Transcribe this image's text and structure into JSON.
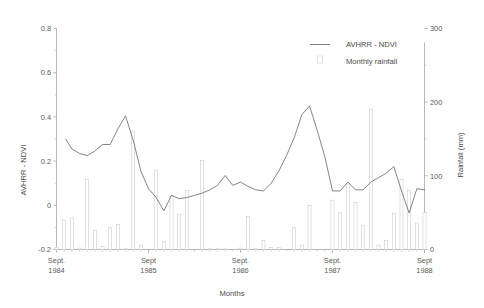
{
  "chart_data": {
    "type": "line",
    "title": "",
    "xlabel": "Months",
    "ylabel": "AVHRR - NDVI",
    "y2label": "Rainfall (mm)",
    "ylim": [
      -0.2,
      0.8
    ],
    "y2lim": [
      0,
      300
    ],
    "yticks": [
      "0.8",
      "0.6",
      "0.4",
      "0.2",
      "0",
      "-0.2"
    ],
    "ytick_values": [
      0.8,
      0.6,
      0.4,
      0.2,
      0,
      -0.2
    ],
    "y2ticks": [
      "300",
      "200",
      "100",
      "0"
    ],
    "y2tick_values": [
      300,
      200,
      100,
      0
    ],
    "grid": false,
    "legend_position": "top-right",
    "legend": [
      {
        "label": "AVHRR - NDVI",
        "marker": "line",
        "color": "#6f6f6f"
      },
      {
        "label": "Monthly rainfall",
        "marker": "bar",
        "color": "#c9c9c9"
      }
    ],
    "xtick_labels": [
      {
        "month": "Sept.",
        "year": "1984",
        "index": 0
      },
      {
        "month": "Sept",
        "year": "1985",
        "index": 12
      },
      {
        "month": "Sept.",
        "year": "1986",
        "index": 24
      },
      {
        "month": "Sept.",
        "year": "1987",
        "index": 36
      },
      {
        "month": "Sept",
        "year": "1988",
        "index": 48
      }
    ],
    "x_index_range": [
      0,
      48
    ],
    "series": [
      {
        "name": "AVHRR - NDVI",
        "type": "line",
        "axis": "left",
        "x": [
          1.2,
          2.0,
          3.0,
          4.0,
          5.0,
          6.0,
          7.0,
          8.0,
          9.0,
          10.0,
          11.0,
          12.0,
          13.0,
          14.0,
          15.0,
          16.0,
          17.0,
          18.0,
          19.0,
          20.0,
          21.0,
          22.0,
          23.0,
          24.0,
          25.0,
          26.0,
          27.0,
          28.0,
          29.0,
          30.0,
          31.0,
          32.0,
          33.0,
          34.0,
          35.0,
          36.0,
          37.0,
          38.0,
          39.0,
          40.0,
          41.0,
          42.0,
          43.0,
          44.0,
          45.0,
          46.0,
          47.0,
          48.0
        ],
        "values": [
          0.3,
          0.255,
          0.235,
          0.225,
          0.245,
          0.275,
          0.275,
          0.345,
          0.405,
          0.295,
          0.155,
          0.075,
          0.035,
          -0.025,
          0.045,
          0.03,
          0.035,
          0.045,
          0.055,
          0.07,
          0.09,
          0.135,
          0.09,
          0.105,
          0.085,
          0.07,
          0.065,
          0.1,
          0.155,
          0.225,
          0.305,
          0.41,
          0.45,
          0.34,
          0.22,
          0.065,
          0.065,
          0.105,
          0.07,
          0.07,
          0.105,
          0.125,
          0.145,
          0.175,
          0.065,
          -0.035,
          0.075,
          0.07
        ]
      },
      {
        "name": "Monthly rainfall",
        "type": "bar",
        "axis": "right",
        "x": [
          0,
          1,
          2,
          3,
          4,
          5,
          6,
          7,
          8,
          9,
          10,
          11,
          12,
          13,
          14,
          15,
          16,
          17,
          18,
          19,
          20,
          21,
          22,
          23,
          24,
          25,
          26,
          27,
          28,
          29,
          30,
          31,
          32,
          33,
          34,
          35,
          36,
          37,
          38,
          39,
          40,
          41,
          42,
          43,
          44,
          45,
          46,
          47,
          48
        ],
        "values": [
          3,
          40,
          43,
          2,
          95,
          26,
          4,
          30,
          34,
          1,
          160,
          6,
          0,
          108,
          11,
          72,
          48,
          80,
          0,
          121,
          1,
          1,
          1,
          0,
          2,
          45,
          1,
          12,
          3,
          3,
          0,
          30,
          6,
          60,
          0,
          0,
          67,
          50,
          89,
          64,
          33,
          190,
          6,
          12,
          49,
          95,
          80,
          36,
          50
        ]
      }
    ]
  }
}
